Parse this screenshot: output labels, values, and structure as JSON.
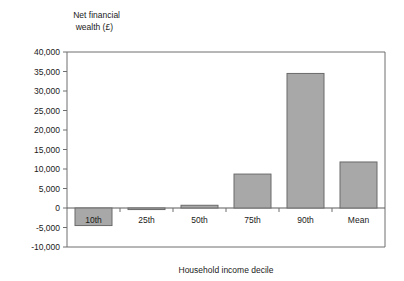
{
  "chart_data": {
    "type": "bar",
    "title": "",
    "ylabel": "Net financial\nwealth (£)",
    "ylabel_line1": "Net financial",
    "ylabel_line2": "wealth (£)",
    "xlabel": "Household income decile",
    "categories": [
      "10th",
      "25th",
      "50th",
      "75th",
      "90th",
      "Mean"
    ],
    "values": [
      -4500,
      -400,
      700,
      8700,
      34500,
      11800
    ],
    "ylim": [
      -10000,
      40000
    ],
    "ytick_values": [
      40000,
      35000,
      30000,
      25000,
      20000,
      15000,
      10000,
      5000,
      0,
      -5000,
      -10000
    ],
    "ytick_labels": [
      "40,000",
      "35,000",
      "30,000",
      "25,000",
      "20,000",
      "15,000",
      "10,000",
      "5,000",
      "0",
      "-5,000",
      "-10,000"
    ],
    "grid": false,
    "legend": null,
    "bar_color": "#a8a8a8",
    "bar_edge_color": "#6a6a6a",
    "axis_color": "#6e6e6e",
    "text_color": "#1a1a1a",
    "background_color": "#ffffff"
  }
}
